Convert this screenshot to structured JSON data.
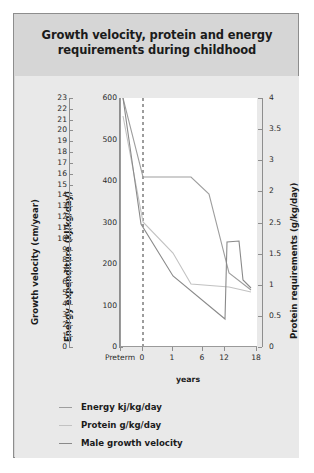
{
  "card": {
    "title": "Growth velocity, protein and energy requirements during childhood"
  },
  "axes": {
    "left_outer_title": "Growth velocity (cm/year)",
    "left_inner_title": "Energy expenditure (kJ/kg/day)",
    "right_title": "Protein requirements (g/kg/day)",
    "x_title": "years",
    "growth_ticks": [
      "23",
      "22",
      "21",
      "20",
      "19",
      "18",
      "17",
      "16",
      "15",
      "14",
      "13",
      "12",
      "11",
      "10",
      "9",
      "8",
      "7",
      "6",
      "5",
      "4",
      "3",
      "2",
      "1",
      "0"
    ],
    "energy_ticks": [
      "600",
      "500",
      "400",
      "300",
      "200",
      "100",
      "0"
    ],
    "protein_ticks": [
      "4",
      "3.5",
      "3",
      "2",
      "2.5",
      "1.5",
      "1",
      "0.5",
      "0"
    ],
    "x_ticks": [
      "Preterm",
      "0",
      "1",
      "6",
      "12",
      "18"
    ]
  },
  "legend": {
    "items": [
      {
        "label": "Energy kj/kg/day",
        "color": "#9e9e9e"
      },
      {
        "label": "Protein g/kg/day",
        "color": "#c2c2c2"
      },
      {
        "label": "Male growth velocity",
        "color": "#8a8a8a"
      }
    ]
  },
  "chart_data": {
    "type": "line",
    "title": "Growth velocity, protein and energy requirements during childhood",
    "xlabel": "years",
    "x_categories": [
      "Preterm",
      "0",
      "1",
      "6",
      "12",
      "18"
    ],
    "grid": false,
    "legend_position": "below",
    "axes": [
      {
        "name": "Growth velocity (cm/year)",
        "side": "left-outer",
        "min": 0,
        "max": 23
      },
      {
        "name": "Energy expenditure (kJ/kg/day)",
        "side": "left-inner",
        "min": 0,
        "max": 600
      },
      {
        "name": "Protein requirements (g/kg/day)",
        "side": "right",
        "min": 0,
        "max": 4
      }
    ],
    "series": [
      {
        "name": "Energy kj/kg/day",
        "axis": "Energy expenditure (kJ/kg/day)",
        "unit": "kJ/kg/day",
        "color": "#9e9e9e",
        "x": [
          "Preterm",
          "0",
          "1",
          "6",
          "12",
          "18"
        ],
        "values": [
          600,
          410,
          410,
          395,
          250,
          190
        ]
      },
      {
        "name": "Protein g/kg/day",
        "axis": "Protein requirements (g/kg/day)",
        "unit": "g/kg/day",
        "color": "#c2c2c2",
        "x": [
          "Preterm",
          "0",
          "1",
          "6",
          "12",
          "18"
        ],
        "values": [
          3.7,
          2.0,
          1.4,
          1.05,
          1.0,
          0.95
        ]
      },
      {
        "name": "Male growth velocity",
        "axis": "Growth velocity (cm/year)",
        "unit": "cm/year",
        "color": "#8a8a8a",
        "x": [
          "Preterm",
          "0",
          "1",
          "6",
          "12",
          "18"
        ],
        "values": [
          23.0,
          14.0,
          8.5,
          5.5,
          2.2,
          0.2
        ],
        "annotation": "pubertal growth spurt peak near age 12-13"
      }
    ]
  }
}
